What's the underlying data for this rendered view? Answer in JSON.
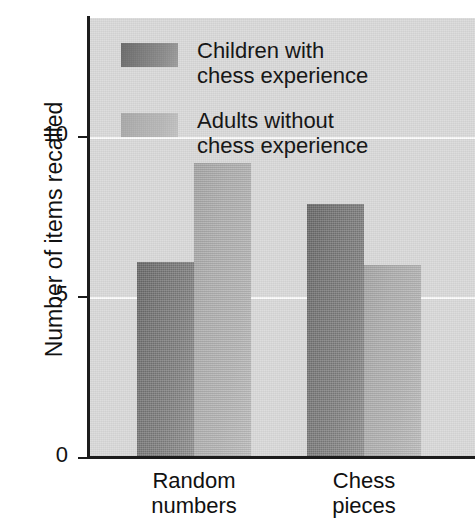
{
  "chart_data": {
    "type": "bar",
    "title": "",
    "subtitle": "",
    "xlabel": "",
    "ylabel": "Number of items recalled",
    "categories": [
      "Random\nnumbers",
      "Chess\npieces"
    ],
    "series": [
      {
        "name": "Children with\nchess experience",
        "values": [
          6.1,
          7.9
        ],
        "color": "#808080"
      },
      {
        "name": "Adults without\nchess experience",
        "values": [
          9.2,
          6.0
        ],
        "color": "#b8b8b8"
      }
    ],
    "ylim": [
      0,
      13.7
    ],
    "yticks": [
      0,
      5,
      10
    ],
    "ytick_labels": [
      "0",
      "5",
      "10"
    ],
    "grid": true,
    "gridline_color": "#fdfdfd",
    "legend_position": "upper-left-inside",
    "plot_background": "#dcdcdc",
    "page_background": "#ffffff",
    "axis_color": "#1c1c1c"
  },
  "axis": {
    "y_title": "Number of items recalled",
    "ticks": [
      {
        "label": "10",
        "value": 10
      },
      {
        "label": "5",
        "value": 5
      },
      {
        "label": "0",
        "value": 0
      }
    ]
  },
  "categories": [
    {
      "line1": "Random",
      "line2": "numbers"
    },
    {
      "line1": "Chess",
      "line2": "pieces"
    }
  ],
  "legend": {
    "entries": [
      {
        "line1": "Children with",
        "line2": "chess experience",
        "swatch": "dark-gray-swatch"
      },
      {
        "line1": "Adults without",
        "line2": "chess experience",
        "swatch": "light-gray-swatch"
      }
    ]
  },
  "bars": [
    {
      "id": "children-random-numbers",
      "value": 6.1
    },
    {
      "id": "adults-random-numbers",
      "value": 9.2
    },
    {
      "id": "children-chess-pieces",
      "value": 7.9
    },
    {
      "id": "adults-chess-pieces",
      "value": 6.0
    }
  ]
}
